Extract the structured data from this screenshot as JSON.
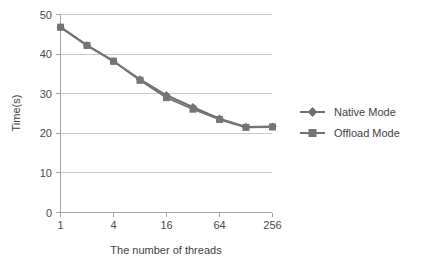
{
  "chart_data": {
    "type": "line",
    "title": "",
    "xlabel": "The number of threads",
    "ylabel": "Time(s)",
    "x": [
      1,
      2,
      4,
      8,
      16,
      32,
      64,
      128,
      256
    ],
    "x_tick_labels": [
      "1",
      "4",
      "16",
      "64",
      "256"
    ],
    "x_tick_values": [
      1,
      4,
      16,
      64,
      256
    ],
    "x_scale": "log2",
    "xlim": [
      1,
      256
    ],
    "y_tick_labels": [
      "0",
      "10",
      "20",
      "30",
      "40",
      "50"
    ],
    "y_tick_values": [
      0,
      10,
      20,
      30,
      40,
      50
    ],
    "ylim": [
      0,
      50
    ],
    "grid": "horizontal",
    "legend_position": "right",
    "series": [
      {
        "name": "Native Mode",
        "marker": "diamond",
        "color": "#6e6e6e",
        "values": [
          46.8,
          42.2,
          38.2,
          33.6,
          29.6,
          26.6,
          23.7,
          21.6,
          21.7
        ]
      },
      {
        "name": "Offload Mode",
        "marker": "square",
        "color": "#747474",
        "values": [
          46.8,
          42.2,
          38.2,
          33.4,
          29.0,
          26.1,
          23.5,
          21.5,
          21.6
        ]
      }
    ]
  },
  "axes": {
    "y_ticks": [
      {
        "label": "50"
      },
      {
        "label": "40"
      },
      {
        "label": "30"
      },
      {
        "label": "20"
      },
      {
        "label": "10"
      },
      {
        "label": "0"
      }
    ],
    "x_ticks": [
      {
        "label": "1"
      },
      {
        "label": "4"
      },
      {
        "label": "16"
      },
      {
        "label": "64"
      },
      {
        "label": "256"
      }
    ],
    "y_axis_title": "Time(s)",
    "x_axis_title": "The number of threads"
  },
  "legend": {
    "entries": [
      {
        "label": "Native Mode"
      },
      {
        "label": "Offload Mode"
      }
    ]
  },
  "colors": {
    "series_native": "#6e6e6e",
    "series_offload": "#747474",
    "gridline": "#c8c8c8",
    "axis": "#a6a6a6",
    "text": "#3f3f3f",
    "background": "#ffffff"
  }
}
